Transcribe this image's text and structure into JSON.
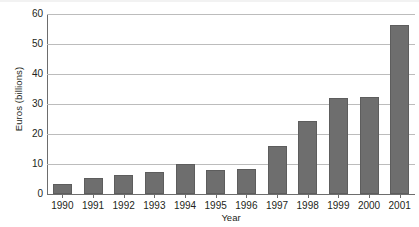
{
  "chart_data": {
    "type": "bar",
    "title": "",
    "xlabel": "Year",
    "ylabel": "Euros (billions)",
    "categories": [
      "1990",
      "1991",
      "1992",
      "1993",
      "1994",
      "1995",
      "1996",
      "1997",
      "1998",
      "1999",
      "2000",
      "2001"
    ],
    "values": [
      3.2,
      5.2,
      6.4,
      7.3,
      10.0,
      8.1,
      8.5,
      16.1,
      24.2,
      32.0,
      32.2,
      56.2
    ],
    "ylim": [
      0,
      60
    ],
    "ytick_labels": [
      "0",
      "10",
      "20",
      "30",
      "40",
      "50",
      "60"
    ],
    "ytick_values": [
      0,
      10,
      20,
      30,
      40,
      50,
      60
    ],
    "grid": true,
    "legend": false,
    "series_name": "Euros (billions)",
    "colors": {
      "bar_fill": "#6e6e6e",
      "bar_edge": "#5d5d5d",
      "gridline": "#bcbcbc",
      "axis": "#6d6d6d",
      "text": "#231f20",
      "background": "#ffffff"
    }
  }
}
